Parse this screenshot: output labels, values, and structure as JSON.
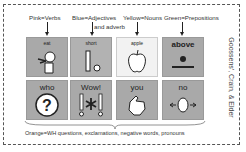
{
  "legend": {
    "pink": "Pink=Verbs",
    "blue_line1": "Blue=Adjectives",
    "blue_line2": "and adverb",
    "yellow": "Yellow=Nouns",
    "green": "Green=Prepositions"
  },
  "cells": [
    {
      "word": "eat",
      "icon": "person-eating-icon"
    },
    {
      "word": "short",
      "icon": "short-bar-icon"
    },
    {
      "word": "apple",
      "icon": "apple-icon"
    },
    {
      "word": "above",
      "icon": "dot-above-line-icon"
    },
    {
      "word": "who",
      "icon": "head-question-icon"
    },
    {
      "word": "Wow!",
      "icon": "exclamation-star-icon"
    },
    {
      "word": "you",
      "icon": "pointing-hand-icon"
    },
    {
      "word": "no",
      "icon": "face-arrows-icon"
    }
  ],
  "caption": "Orange=WH questions, exclamations, negative words, pronouns",
  "attribution": "Goossens', Crain, & Elder"
}
